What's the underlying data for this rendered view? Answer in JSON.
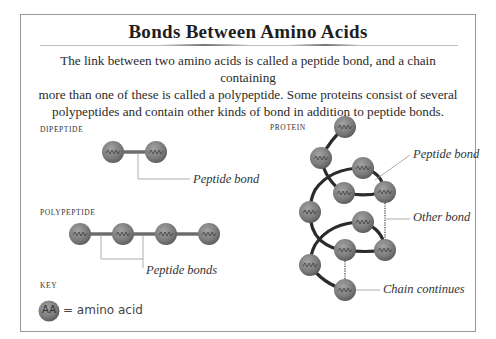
{
  "title": "Bonds Between Amino Acids",
  "intro": {
    "lines": [
      "The link between two amino acids is called a peptide bond, and a chain containing",
      "more than one of these is called a polypeptide. Some proteins consist of several",
      "polypeptides and contain other kinds of bond in addition to peptide bonds."
    ]
  },
  "colors": {
    "amino_acid_fill": "#7b7b7b",
    "bond": "#2b2b2b",
    "leader_line": "#999999",
    "frame": "#9a9a9a"
  },
  "sections": {
    "dipeptide": {
      "label": "DIPEPTIDE",
      "nodes": [
        "AA1",
        "AA2"
      ],
      "callout": "Peptide bond"
    },
    "polypeptide": {
      "label": "POLYPEPTIDE",
      "nodes": [
        "AA1",
        "AA2",
        "AA3",
        "AA4"
      ],
      "callout": "Peptide bonds"
    },
    "protein": {
      "label": "PROTEIN",
      "nodes": [
        "AA1",
        "AA2",
        "AA3",
        "AA4",
        "AA5",
        "AA6",
        "AA7",
        "AA8",
        "AA9",
        "AA10",
        "AA11"
      ],
      "callouts": {
        "peptide_bond": "Peptide bond",
        "other_bond": "Other bond",
        "chain_continues": "Chain continues"
      }
    }
  },
  "key": {
    "label": "KEY",
    "symbol": "AA",
    "text": "= amino acid"
  }
}
